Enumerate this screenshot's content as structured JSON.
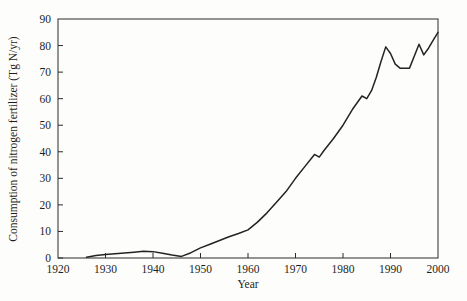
{
  "figure": {
    "background_color": "#fdfdfb",
    "line_color": "#232323",
    "axis_color": "#2b2b2b"
  },
  "chart_data": {
    "type": "line",
    "title": "",
    "xlabel": "Year",
    "ylabel": "Consumption of nitrogen fertilizer (Tg N/yr)",
    "xlim": [
      1920,
      2000
    ],
    "ylim": [
      0,
      90
    ],
    "xticks": [
      1920,
      1930,
      1940,
      1950,
      1960,
      1970,
      1980,
      1990,
      2000
    ],
    "xtick_labels": [
      "1920",
      "1930",
      "1940",
      "1950",
      "1960",
      "1970",
      "1980",
      "1990",
      "2000"
    ],
    "yticks": [
      0,
      10,
      20,
      30,
      40,
      50,
      60,
      70,
      80,
      90
    ],
    "ytick_labels": [
      "0",
      "10",
      "20",
      "30",
      "40",
      "50",
      "60",
      "70",
      "80",
      "90"
    ],
    "grid": false,
    "legend": "none",
    "series": [
      {
        "name": "Consumption of nitrogen fertilizer",
        "x": [
          1926,
          1928,
          1930,
          1932,
          1934,
          1936,
          1938,
          1940,
          1942,
          1944,
          1946,
          1948,
          1950,
          1952,
          1954,
          1956,
          1958,
          1960,
          1962,
          1964,
          1966,
          1968,
          1970,
          1972,
          1974,
          1975,
          1976,
          1978,
          1980,
          1982,
          1984,
          1985,
          1986,
          1987,
          1988,
          1989,
          1990,
          1991,
          1992,
          1993,
          1994,
          1995,
          1996,
          1997,
          1998,
          1999,
          2000
        ],
        "y": [
          0.3,
          0.9,
          1.3,
          1.6,
          1.9,
          2.2,
          2.5,
          2.4,
          1.8,
          1.1,
          0.6,
          2.0,
          3.8,
          5.2,
          6.6,
          8.0,
          9.2,
          10.6,
          13.5,
          17.0,
          21.0,
          25.0,
          30.0,
          34.5,
          39.0,
          38.0,
          40.5,
          45.0,
          50.0,
          56.0,
          61.0,
          60.0,
          63.0,
          68.0,
          74.0,
          79.5,
          77.0,
          73.0,
          71.5,
          71.5,
          71.5,
          76.0,
          80.5,
          76.5,
          79.0,
          82.0,
          85.0
        ]
      }
    ]
  }
}
